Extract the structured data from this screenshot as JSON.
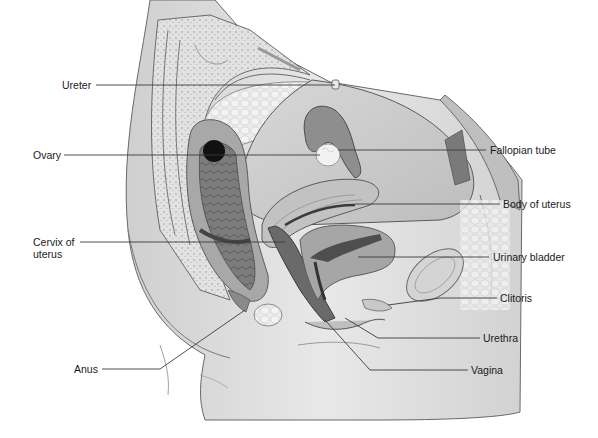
{
  "diagram": {
    "type": "anatomical sagittal section",
    "colors": {
      "skin": "#dcdcdc",
      "skin_shadow": "#c4c4c4",
      "tissue_light": "#ececec",
      "fat_cells": "#e6e6e6",
      "organ_mid": "#9a9a9a",
      "organ_dark": "#6e6e6e",
      "lumen": "#4a4a4a",
      "ovary_dark": "#111111",
      "outline": "#5a5a5a",
      "leader_line": "#3a3a3a"
    },
    "labels": {
      "ureter": "Ureter",
      "ovary": "Ovary",
      "cervix_line1": "Cervix of",
      "cervix_line2": "uterus",
      "anus": "Anus",
      "fallopian_tube": "Fallopian tube",
      "body_of_uterus": "Body of uterus",
      "urinary_bladder": "Urinary bladder",
      "clitoris": "Clitoris",
      "urethra": "Urethra",
      "vagina": "Vagina"
    }
  }
}
